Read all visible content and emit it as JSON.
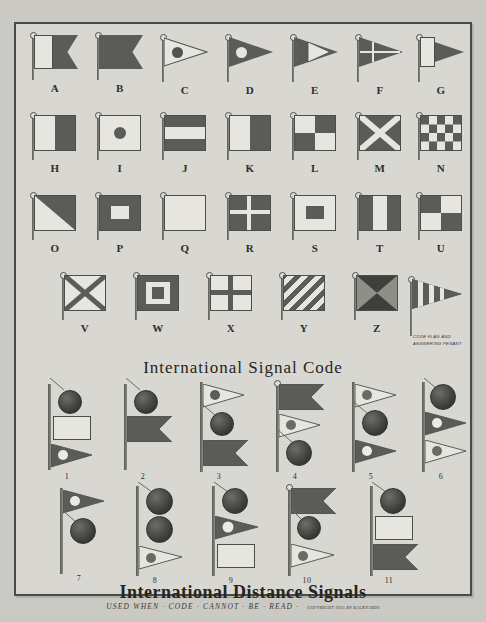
{
  "document": {
    "kind": "vintage-print-chart",
    "section_titles": {
      "signal_code": "International Signal Code",
      "distance_signals": "International Distance Signals",
      "distance_subtitle": "USED WHEN · CODE · CANNOT · BE · READ ·",
      "copyright": "COPYRIGHT 1925 BY BACKYARDS"
    },
    "pennant_note": "CODE FLAG AND ANSWERING PENANT"
  },
  "alphabet_rows": [
    [
      {
        "letter": "A",
        "shape": "swallowtail",
        "desc": "white hoist, dark fly swallowtail"
      },
      {
        "letter": "B",
        "shape": "swallowtail",
        "desc": "solid dark swallowtail"
      },
      {
        "letter": "C",
        "shape": "pennant",
        "desc": "light pennant with dark disc"
      },
      {
        "letter": "D",
        "shape": "pennant",
        "desc": "dark pennant with light disc"
      },
      {
        "letter": "E",
        "shape": "pennant",
        "desc": "dark pennant with light wedge"
      },
      {
        "letter": "F",
        "shape": "pennant",
        "desc": "dark pennant with light cross"
      },
      {
        "letter": "G",
        "shape": "pennant",
        "desc": "light hoist, dark fly pennant"
      }
    ],
    [
      {
        "letter": "H",
        "shape": "square",
        "desc": "light hoist half, dark fly half"
      },
      {
        "letter": "I",
        "shape": "square",
        "desc": "light field with dark centre disc"
      },
      {
        "letter": "J",
        "shape": "square",
        "desc": "dark-light-dark horizontal bands"
      },
      {
        "letter": "K",
        "shape": "square",
        "desc": "light hoist half, dark fly half"
      },
      {
        "letter": "L",
        "shape": "square",
        "desc": "quartered light and dark"
      },
      {
        "letter": "M",
        "shape": "square",
        "desc": "dark field, light saltire"
      },
      {
        "letter": "N",
        "shape": "square",
        "desc": "checkerboard"
      }
    ],
    [
      {
        "letter": "O",
        "shape": "square",
        "desc": "diagonal light over dark"
      },
      {
        "letter": "P",
        "shape": "square",
        "desc": "dark field, light centre rectangle"
      },
      {
        "letter": "Q",
        "shape": "square",
        "desc": "plain light field"
      },
      {
        "letter": "R",
        "shape": "square",
        "desc": "dark field, light cross"
      },
      {
        "letter": "S",
        "shape": "square",
        "desc": "light field, dark centre rectangle"
      },
      {
        "letter": "T",
        "shape": "square",
        "desc": "dark-light-dark vertical bands"
      },
      {
        "letter": "U",
        "shape": "square",
        "desc": "quartered dark and light"
      }
    ],
    [
      {
        "letter": "V",
        "shape": "square",
        "desc": "light field, dark saltire"
      },
      {
        "letter": "W",
        "shape": "square",
        "desc": "dark border, light ring, dark centre"
      },
      {
        "letter": "X",
        "shape": "square",
        "desc": "light field, dark cross"
      },
      {
        "letter": "Y",
        "shape": "square",
        "desc": "diagonal stripes"
      },
      {
        "letter": "Z",
        "shape": "square",
        "desc": "four triangles from centre"
      },
      {
        "letter": "CODE",
        "shape": "pennant",
        "desc": "vertically striped answering pennant"
      }
    ]
  ],
  "distance_signals": [
    {
      "number": "1",
      "hoist": [
        "ball",
        "light-square",
        "light-pennant-dark-disc"
      ]
    },
    {
      "number": "2",
      "hoist": [
        "ball",
        "dark-swallowtail"
      ]
    },
    {
      "number": "3",
      "hoist": [
        "light-pennant-dark-disc",
        "ball",
        "dark-swallowtail"
      ]
    },
    {
      "number": "4",
      "hoist": [
        "dark-swallowtail",
        "light-pennant-dark-disc",
        "ball"
      ]
    },
    {
      "number": "5",
      "hoist": [
        "light-pennant-dark-disc",
        "ball",
        "dark-pennant-light-disc"
      ]
    },
    {
      "number": "6",
      "hoist": [
        "ball",
        "dark-pennant-light-disc",
        "light-pennant-dark-disc"
      ]
    },
    {
      "number": "7",
      "hoist": [
        "dark-pennant-light-disc",
        "ball"
      ]
    },
    {
      "number": "8",
      "hoist": [
        "ball",
        "ball",
        "light-pennant-dark-disc"
      ]
    },
    {
      "number": "9",
      "hoist": [
        "ball",
        "dark-pennant-light-disc",
        "light-square"
      ]
    },
    {
      "number": "10",
      "hoist": [
        "dark-swallowtail",
        "ball",
        "light-pennant-dark-disc"
      ]
    },
    {
      "number": "11",
      "hoist": [
        "ball",
        "light-square",
        "dark-swallowtail"
      ]
    }
  ],
  "colors": {
    "paper": "#d9d7d1",
    "ink_dark": "#5b5b57",
    "ink_light": "#e7e5df",
    "rule": "#4d4d48",
    "text": "#25251f"
  }
}
